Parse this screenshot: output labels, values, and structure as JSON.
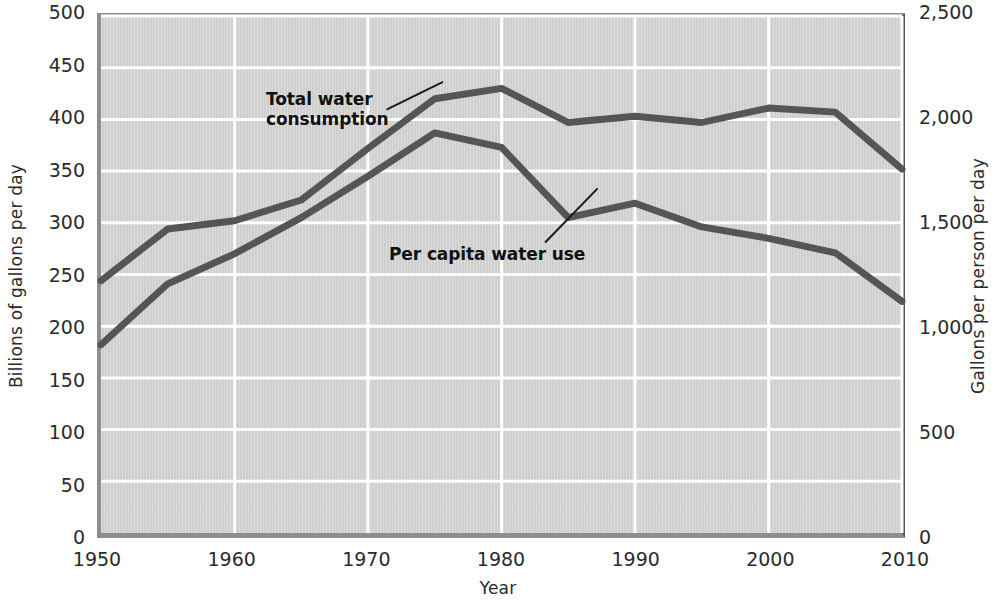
{
  "chart_data": {
    "type": "line",
    "title": "",
    "subtitle": "",
    "xlabel": "Year",
    "ylabel": "Billions of gallons per day",
    "ylabel_right": "Gallons per person per day",
    "x": [
      1950,
      1955,
      1960,
      1965,
      1970,
      1975,
      1980,
      1985,
      1990,
      1995,
      2000,
      2005,
      2010
    ],
    "xlim": [
      1950,
      2010
    ],
    "ylim": [
      0,
      500
    ],
    "ylim_right": [
      0,
      2500
    ],
    "grid": true,
    "legend_position": "inline-annotations",
    "series": [
      {
        "name": "Total water consumption",
        "axis": "left",
        "units": "Billions of gallons per day",
        "values": [
          244,
          294,
          302,
          322,
          372,
          420,
          430,
          397,
          403,
          397,
          411,
          407,
          352
        ]
      },
      {
        "name": "Per capita water use",
        "axis": "right",
        "units": "Gallons per person per day",
        "values_left_scale": [
          182,
          241,
          270,
          305,
          345,
          387,
          373,
          305,
          319,
          296,
          285,
          271,
          224
        ],
        "values": [
          910,
          1205,
          1350,
          1525,
          1725,
          1935,
          1865,
          1525,
          1595,
          1480,
          1425,
          1355,
          1120
        ]
      }
    ],
    "annotations": [
      {
        "name": "total-water-consumption-label",
        "text": "Total water\nconsumption"
      },
      {
        "name": "per-capita-water-use-label",
        "text": "Per capita water use"
      }
    ],
    "yticks_left": [
      "0",
      "50",
      "100",
      "150",
      "200",
      "250",
      "300",
      "350",
      "400",
      "450",
      "500"
    ],
    "yticks_left_values": [
      0,
      50,
      100,
      150,
      200,
      250,
      300,
      350,
      400,
      450,
      500
    ],
    "yticks_right": [
      "0",
      "500",
      "1,000",
      "1,500",
      "2,000",
      "2,500"
    ],
    "yticks_right_values": [
      0,
      500,
      1000,
      1500,
      2000,
      2500
    ],
    "xticks": [
      "1950",
      "1960",
      "1970",
      "1980",
      "1990",
      "2000",
      "2010"
    ],
    "xticks_values": [
      1950,
      1960,
      1970,
      1980,
      1990,
      2000,
      2010
    ],
    "colors": {
      "line": "#555555",
      "plot_background": "#d2d2d2",
      "gridline": "#ffffff",
      "frame": "#8e8e8e",
      "text": "#2b2b2b"
    }
  }
}
